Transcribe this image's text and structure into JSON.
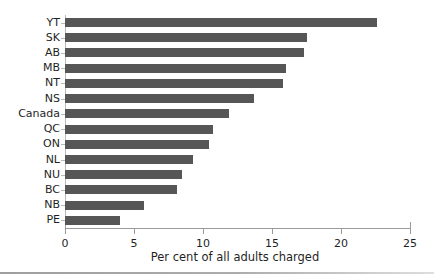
{
  "chart_data": {
    "type": "bar",
    "orientation": "horizontal",
    "title": "",
    "subtitle": "",
    "xlabel": "Per cent of all adults charged",
    "ylabel": "",
    "categories": [
      "YT",
      "SK",
      "AB",
      "MB",
      "NT",
      "NS",
      "Canada",
      "QC",
      "ON",
      "NL",
      "NU",
      "BC",
      "NB",
      "PE"
    ],
    "values": [
      22.6,
      17.5,
      17.3,
      16.0,
      15.8,
      13.7,
      11.9,
      10.7,
      10.4,
      9.3,
      8.5,
      8.1,
      5.7,
      4.0
    ],
    "series": [
      {
        "name": "Per cent of all adults charged",
        "values": [
          22.6,
          17.5,
          17.3,
          16.0,
          15.8,
          13.7,
          11.9,
          10.7,
          10.4,
          9.3,
          8.5,
          8.1,
          5.7,
          4.0
        ]
      }
    ],
    "xlim": [
      0,
      25
    ],
    "xticks": [
      0,
      5,
      10,
      15,
      20,
      25
    ],
    "xtick_labels": [
      "0",
      "5",
      "10",
      "15",
      "20",
      "25"
    ],
    "grid": false,
    "legend": false,
    "legend_position": "none",
    "bar_color": "#565656",
    "axis_color": "#9a9a9a",
    "background": "#ffffff",
    "note": "Right-most tick label 25 is clipped by the image edge"
  },
  "axis": {
    "x_title": "Per cent of all adults charged"
  }
}
